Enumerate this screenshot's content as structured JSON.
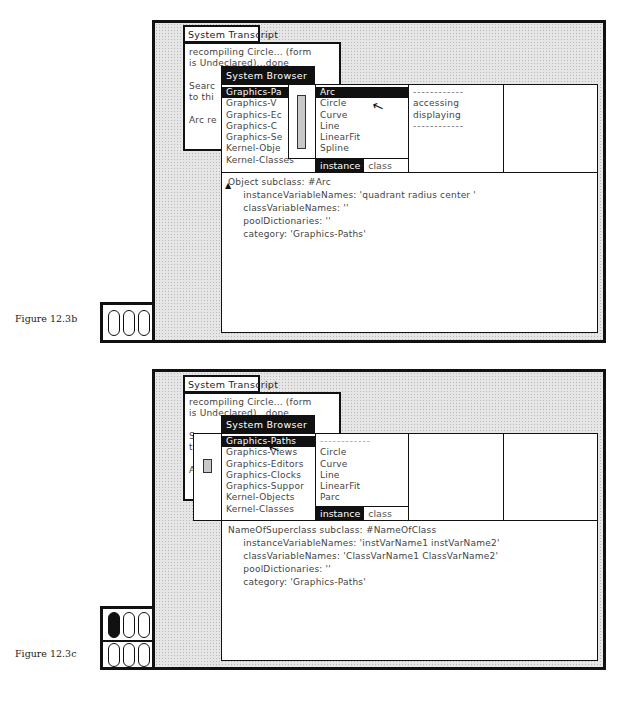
{
  "figures": [
    {
      "caption": "Figure 12.3b",
      "transcript": {
        "title": "System Transcript",
        "lines": [
          "recompiling Circle... (form",
          "is Undeclared)...done",
          "",
          "Searc",
          "to thi",
          "",
          "Arc re"
        ]
      },
      "browser": {
        "title": "System Browser",
        "categories": [
          "Graphics-Pa",
          "Graphics-V",
          "Graphics-Ec",
          "Graphics-C",
          "Graphics-Se",
          "Kernel-Obje",
          "Kernel-Classes"
        ],
        "selected_category": 0,
        "classes": [
          "Arc",
          "Circle",
          "Curve",
          "Line",
          "LinearFit",
          "Spline"
        ],
        "selected_class": 0,
        "protocols": [
          "------------",
          "accessing",
          "displaying",
          "------------"
        ],
        "methods": [],
        "switch": {
          "instance": "instance",
          "class": "class",
          "active": "instance"
        },
        "code": [
          "Object subclass: #Arc",
          "     instanceVariableNames: 'quadrant radius center '",
          "     classVariableNames: ''",
          "     poolDictionaries: ''",
          "     category: 'Graphics-Paths'"
        ]
      },
      "collapsed_icons": [
        {
          "pills": [
            "empty",
            "empty",
            "empty"
          ]
        }
      ]
    },
    {
      "caption": "Figure 12.3c",
      "transcript": {
        "title": "System Transcript",
        "lines": [
          "recompiling Circle... (form",
          "is Undeclared)...done",
          "",
          "S",
          "t",
          "",
          "A"
        ]
      },
      "browser": {
        "title": "System Browser",
        "categories": [
          "Graphics-Paths",
          "Graphics-Views",
          "Graphics-Editors",
          "Graphics-Clocks",
          "Graphics-Suppor",
          "Kernel-Objects",
          "Kernel-Classes"
        ],
        "selected_category": 0,
        "classes": [
          "------------",
          "Circle",
          "Curve",
          "Line",
          "LinearFit",
          "Parc"
        ],
        "selected_class": -1,
        "protocols": [],
        "methods": [],
        "switch": {
          "instance": "instance",
          "class": "class",
          "active": "instance"
        },
        "code": [
          "NameOfSuperclass subclass: #NameOfClass",
          "     instanceVariableNames: 'instVarName1 instVarName2'",
          "     classVariableNames: 'ClassVarName1 ClassVarName2'",
          "     poolDictionaries: ''",
          "     category: 'Graphics-Paths'"
        ]
      },
      "collapsed_icons": [
        {
          "pills": [
            "filled",
            "empty",
            "empty"
          ]
        },
        {
          "pills": [
            "empty",
            "empty",
            "empty"
          ]
        }
      ]
    }
  ],
  "icons": {
    "cursor": "mouse-pointer-arrow",
    "caret": "text-insertion-caret"
  }
}
